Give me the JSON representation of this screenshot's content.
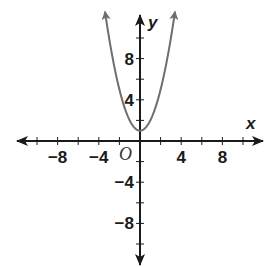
{
  "chart_data": {
    "type": "line",
    "title": "",
    "function": "y = x^2 + 1",
    "xlabel": "x",
    "ylabel": "y",
    "origin_label": "O",
    "xlim": [
      -10,
      10
    ],
    "ylim": [
      -10,
      12
    ],
    "x_tick_step": 2,
    "y_tick_step": 2,
    "x_tick_labels": [
      {
        "value": -8,
        "text": "−8"
      },
      {
        "value": -4,
        "text": "−4"
      },
      {
        "value": 4,
        "text": "4"
      },
      {
        "value": 8,
        "text": "8"
      }
    ],
    "y_tick_labels": [
      {
        "value": 8,
        "text": "8"
      },
      {
        "value": 4,
        "text": "4"
      },
      {
        "value": -4,
        "text": "−4"
      },
      {
        "value": -8,
        "text": "−8"
      }
    ],
    "grid": false,
    "legend": null,
    "series": [
      {
        "name": "y = x^2 + 1",
        "color": "#6e6e6e",
        "x": [
          -3.4,
          -3,
          -2.5,
          -2,
          -1.5,
          -1,
          -0.5,
          0,
          0.5,
          1,
          1.5,
          2,
          2.5,
          3,
          3.4
        ],
        "y": [
          12.56,
          10,
          7.25,
          5,
          3.25,
          2,
          1.25,
          1,
          1.25,
          2,
          3.25,
          5,
          7.25,
          10,
          12.56
        ],
        "arrow_ends": true
      }
    ],
    "colors": {
      "axis": "#1a1a1a",
      "curve": "#6e6e6e"
    }
  }
}
